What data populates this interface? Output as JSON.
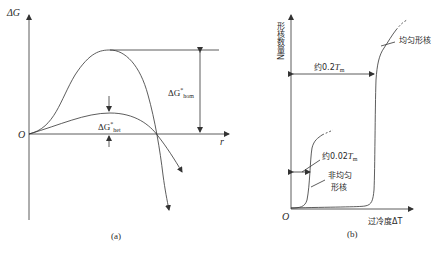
{
  "panel_a": {
    "caption": "(a)",
    "y_axis_label": "ΔG",
    "x_axis_label": "r",
    "origin_label": "O",
    "hom_barrier": {
      "base": "ΔG",
      "sup": "*",
      "sub": "hom"
    },
    "het_barrier": {
      "base": "ΔG",
      "sup": "*",
      "sub": "het"
    },
    "curves": [
      "homogeneous nucleation ΔG(r)",
      "heterogeneous nucleation ΔG(r)"
    ]
  },
  "panel_b": {
    "caption": "(b)",
    "y_axis_label": "形核数量N",
    "x_axis_label": "过冷度ΔT",
    "origin_label": "O",
    "homogeneous_label": "均匀形核",
    "heterogeneous_label_line1": "非均匀",
    "heterogeneous_label_line2": "形核",
    "hom_interval": {
      "prefix": "约0.2",
      "T": "T",
      "sub": "m"
    },
    "het_interval": {
      "prefix": "约0.02",
      "T": "T",
      "sub": "m"
    }
  },
  "colors": {
    "line": "#333333",
    "background": "#ffffff"
  }
}
